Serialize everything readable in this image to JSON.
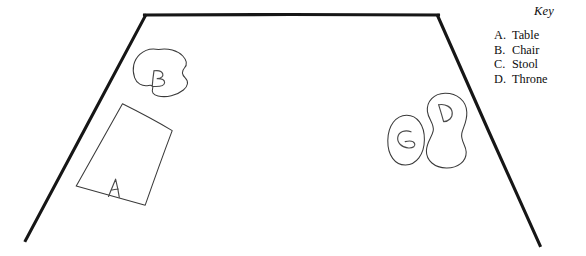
{
  "diagram": {
    "type": "hand-drawn-floor-plan",
    "background_color": "#ffffff",
    "wall_color": "#161616",
    "furniture_color": "#3a3a3a",
    "room": {
      "name": "trapezoidal-room-outline",
      "description": "Open trapezoid: thick left wall slanting up-right, horizontal top wall, thick right wall slanting down-right"
    },
    "shapes": [
      {
        "id": "A",
        "name": "table-shape",
        "form": "tilted rectangle",
        "label": "A"
      },
      {
        "id": "B",
        "name": "chair-shape",
        "form": "rounded blob with notch",
        "label": "B"
      },
      {
        "id": "C",
        "name": "stool-shape",
        "form": "small oval",
        "label": "C"
      },
      {
        "id": "D",
        "name": "throne-shape",
        "form": "tall pill with waist",
        "label": "D"
      }
    ]
  },
  "key": {
    "title": "Key",
    "entries": [
      {
        "letter": "A.",
        "label": "Table"
      },
      {
        "letter": "B.",
        "label": "Chair"
      },
      {
        "letter": "C.",
        "label": "Stool"
      },
      {
        "letter": "D.",
        "label": "Throne"
      }
    ]
  }
}
